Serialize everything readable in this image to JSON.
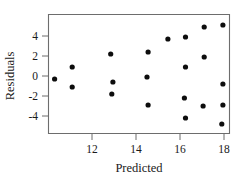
{
  "chart_data": {
    "type": "scatter",
    "title": "",
    "xlabel": "Predicted",
    "ylabel": "Residuals",
    "xlim": [
      10.0,
      18.4
    ],
    "ylim": [
      -5.6,
      5.8
    ],
    "xticks": [
      12,
      14,
      16,
      18
    ],
    "xtick_labels": [
      "12",
      "14",
      "16",
      "18"
    ],
    "yticks": [
      4,
      2,
      0,
      -2,
      -4
    ],
    "ytick_labels": [
      "4",
      "2",
      "0",
      "-2",
      "-4"
    ],
    "grid": false,
    "legend": false,
    "marker": "filled-circle",
    "marker_color": "#0d0d0d",
    "points": [
      {
        "x": 10.3,
        "y": -0.3
      },
      {
        "x": 11.1,
        "y": 0.9
      },
      {
        "x": 11.1,
        "y": -1.1
      },
      {
        "x": 12.85,
        "y": 2.2
      },
      {
        "x": 12.95,
        "y": -0.6
      },
      {
        "x": 12.9,
        "y": -1.8
      },
      {
        "x": 14.55,
        "y": 2.4
      },
      {
        "x": 14.5,
        "y": -0.1
      },
      {
        "x": 14.55,
        "y": -2.9
      },
      {
        "x": 15.45,
        "y": 3.7
      },
      {
        "x": 16.25,
        "y": 3.9
      },
      {
        "x": 16.25,
        "y": 0.9
      },
      {
        "x": 16.2,
        "y": -2.2
      },
      {
        "x": 16.25,
        "y": -4.2
      },
      {
        "x": 17.1,
        "y": 4.9
      },
      {
        "x": 17.1,
        "y": 1.9
      },
      {
        "x": 17.05,
        "y": -3.0
      },
      {
        "x": 17.95,
        "y": 5.1
      },
      {
        "x": 17.95,
        "y": -0.8
      },
      {
        "x": 17.95,
        "y": -2.9
      },
      {
        "x": 17.9,
        "y": -4.8
      }
    ]
  },
  "axes": {
    "x_title": "Predicted",
    "y_title": "Residuals"
  },
  "colors": {
    "axis": "#6d6d6d",
    "marker": "#0d0d0d",
    "text": "#1a1a1a",
    "background": "#ffffff"
  }
}
